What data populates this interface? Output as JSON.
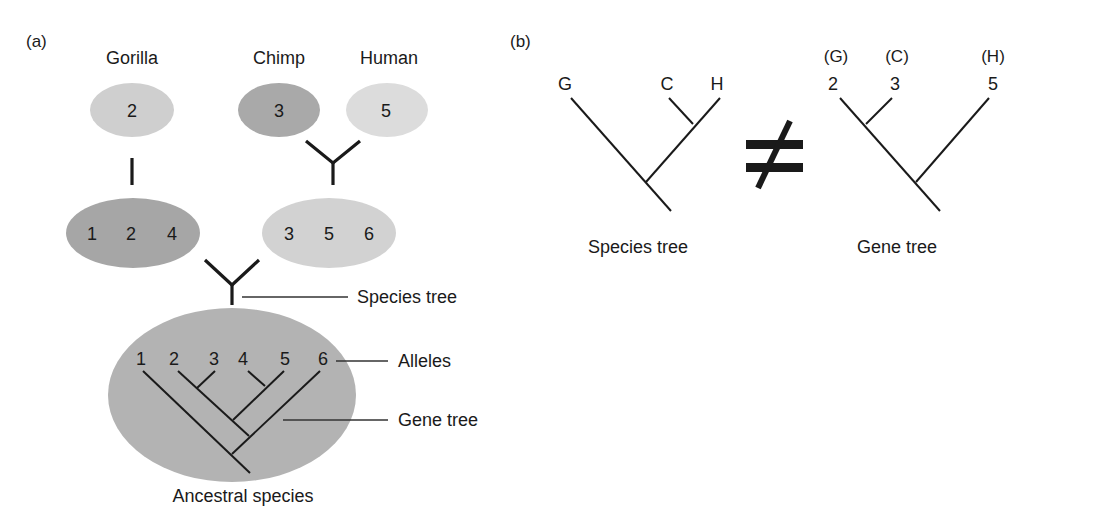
{
  "panel_a": {
    "label": "(a)",
    "species": [
      {
        "name": "Gorilla",
        "allele": "2",
        "color": "#cfcfcf"
      },
      {
        "name": "Chimp",
        "allele": "3",
        "color": "#a9a9a9"
      },
      {
        "name": "Human",
        "allele": "5",
        "color": "#dcdcdc"
      }
    ],
    "pools": [
      {
        "alleles": [
          "1",
          "2",
          "4"
        ],
        "color": "#a6a6a6"
      },
      {
        "alleles": [
          "3",
          "5",
          "6"
        ],
        "color": "#d2d2d2"
      }
    ],
    "ancestral": {
      "alleles": [
        "1",
        "2",
        "3",
        "4",
        "5",
        "6"
      ],
      "color": "#b3b3b3",
      "label": "Ancestral species"
    },
    "annotations": {
      "species_tree": "Species tree",
      "alleles": "Alleles",
      "gene_tree": "Gene tree"
    }
  },
  "panel_b": {
    "label": "(b)",
    "species_tree": {
      "tips": [
        "G",
        "C",
        "H"
      ],
      "caption": "Species tree"
    },
    "not_equal": "≠",
    "gene_tree": {
      "tip_species": [
        "(G)",
        "(C)",
        "(H)"
      ],
      "tips": [
        "2",
        "3",
        "5"
      ],
      "caption": "Gene tree"
    }
  }
}
